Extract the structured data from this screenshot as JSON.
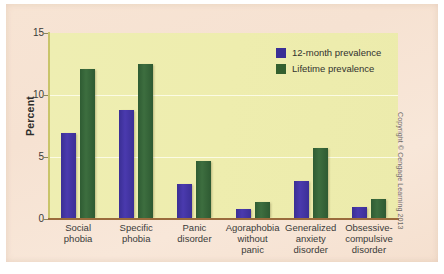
{
  "figure": {
    "copyright": "Copyright © Cengage Learning 2013"
  },
  "chart_data": {
    "type": "bar",
    "title": "",
    "xlabel": "",
    "ylabel": "Percent",
    "ylim": [
      0,
      15
    ],
    "yticks": [
      0,
      5,
      10,
      15
    ],
    "ytick_labels": [
      "0",
      "5",
      "10",
      "15"
    ],
    "grid": true,
    "legend_position": "top-right",
    "categories": [
      "Social phobia",
      "Specific phobia",
      "Panic disorder",
      "Agoraphobia without panic",
      "Generalized anxiety disorder",
      "Obsessive-compulsive disorder"
    ],
    "category_lines": [
      [
        "Social",
        "phobia"
      ],
      [
        "Specific",
        "phobia"
      ],
      [
        "Panic",
        "disorder"
      ],
      [
        "Agoraphobia",
        "without",
        "panic"
      ],
      [
        "Generalized",
        "anxiety",
        "disorder"
      ],
      [
        "Obsessive-",
        "compulsive",
        "disorder"
      ]
    ],
    "series": [
      {
        "name": "12-month prevalence",
        "color": "#3a2f96",
        "values": [
          6.9,
          8.8,
          2.8,
          0.8,
          3.1,
          1.0
        ]
      },
      {
        "name": "Lifetime prevalence",
        "color": "#34602f",
        "values": [
          12.1,
          12.5,
          4.7,
          1.4,
          5.7,
          1.6
        ]
      }
    ],
    "colors": {
      "plot_background": "#eeedb0",
      "card_background": "#f6e3d3",
      "gridline": "#fbfbe4",
      "x_axis": "#9a6b3c",
      "y_axis": "#c9c46a"
    }
  }
}
